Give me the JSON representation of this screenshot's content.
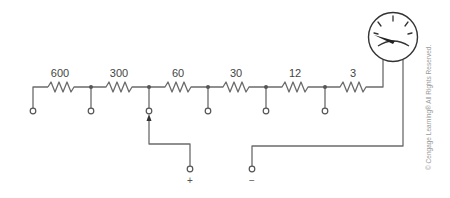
{
  "diagram": {
    "type": "multi-range voltmeter shunt circuit",
    "resistors": [
      {
        "label": "600"
      },
      {
        "label": "300"
      },
      {
        "label": "60"
      },
      {
        "label": "30"
      },
      {
        "label": "12"
      },
      {
        "label": "3"
      }
    ],
    "terminals": {
      "positive_label": "+",
      "negative_label": "−"
    },
    "meter": {
      "icon": "analog-meter-icon"
    },
    "copyright": "© Cengage Learning®  All Rights Reserved."
  },
  "colors": {
    "wire": "#6b6b6b",
    "text": "#444444"
  }
}
